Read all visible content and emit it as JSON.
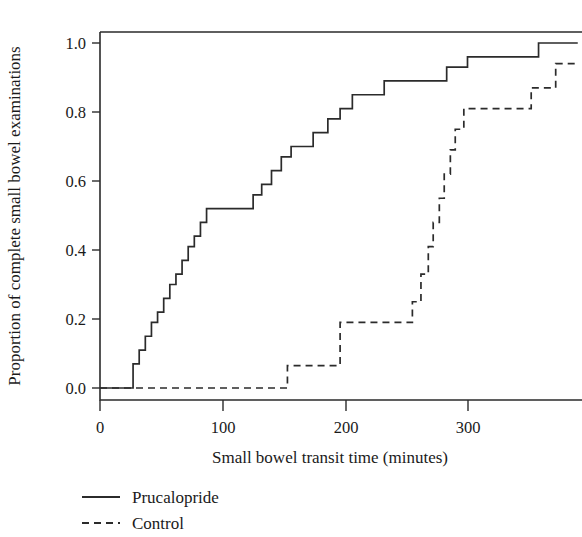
{
  "chart_data": {
    "type": "line",
    "subtype": "step-cumulative-distribution",
    "title": "",
    "xlabel": "Small bowel transit time (minutes)",
    "ylabel": "Proportion of complete small bowel examinations",
    "xlim": [
      -5,
      393
    ],
    "ylim": [
      -0.04,
      1.07
    ],
    "xticks": [
      0,
      100,
      200,
      300
    ],
    "xtick_labels": [
      "0",
      "100",
      "200",
      "300"
    ],
    "yticks": [
      0.0,
      0.2,
      0.4,
      0.6,
      0.8,
      1.0
    ],
    "ytick_labels": [
      "0.0",
      "0.2",
      "0.4",
      "0.6",
      "0.8",
      "1.0"
    ],
    "grid": false,
    "legend_position": "below-axes-left",
    "series": [
      {
        "name": "Prucalopride",
        "style": "solid",
        "color": "#2b2b2b",
        "x": [
          0,
          27,
          27,
          32,
          32,
          37,
          37,
          42,
          42,
          47,
          47,
          52,
          52,
          57,
          57,
          62,
          62,
          67,
          67,
          72,
          72,
          77,
          77,
          82,
          82,
          87,
          87,
          95,
          95,
          125,
          125,
          132,
          132,
          140,
          140,
          148,
          148,
          156,
          156,
          164,
          164,
          174,
          174,
          186,
          186,
          196,
          196,
          206,
          206,
          216,
          216,
          232,
          232,
          260,
          260,
          283,
          283,
          300,
          300,
          358,
          358,
          390
        ],
        "y": [
          0.0,
          0.0,
          0.07,
          0.07,
          0.11,
          0.11,
          0.15,
          0.15,
          0.19,
          0.19,
          0.22,
          0.22,
          0.26,
          0.26,
          0.3,
          0.3,
          0.33,
          0.33,
          0.37,
          0.37,
          0.41,
          0.41,
          0.44,
          0.44,
          0.48,
          0.48,
          0.52,
          0.52,
          0.52,
          0.52,
          0.56,
          0.56,
          0.59,
          0.59,
          0.63,
          0.63,
          0.67,
          0.67,
          0.7,
          0.7,
          0.7,
          0.7,
          0.74,
          0.74,
          0.78,
          0.78,
          0.81,
          0.81,
          0.85,
          0.85,
          0.85,
          0.85,
          0.89,
          0.89,
          0.89,
          0.89,
          0.93,
          0.93,
          0.96,
          0.96,
          1.0,
          1.0
        ]
      },
      {
        "name": "Control",
        "style": "dashed",
        "color": "#2b2b2b",
        "x": [
          0,
          153,
          153,
          196,
          196,
          255,
          255,
          262,
          262,
          268,
          268,
          272,
          272,
          277,
          277,
          281,
          281,
          286,
          286,
          290,
          290,
          297,
          297,
          352,
          352,
          372,
          372,
          390
        ],
        "y": [
          0.0,
          0.0,
          0.065,
          0.065,
          0.19,
          0.19,
          0.25,
          0.25,
          0.33,
          0.33,
          0.41,
          0.41,
          0.48,
          0.48,
          0.55,
          0.55,
          0.62,
          0.62,
          0.69,
          0.69,
          0.75,
          0.75,
          0.81,
          0.81,
          0.87,
          0.87,
          0.94,
          0.94
        ]
      }
    ]
  },
  "legend": {
    "entries": [
      {
        "label": "Prucalopride",
        "style": "solid"
      },
      {
        "label": "Control",
        "style": "dashed"
      }
    ]
  }
}
